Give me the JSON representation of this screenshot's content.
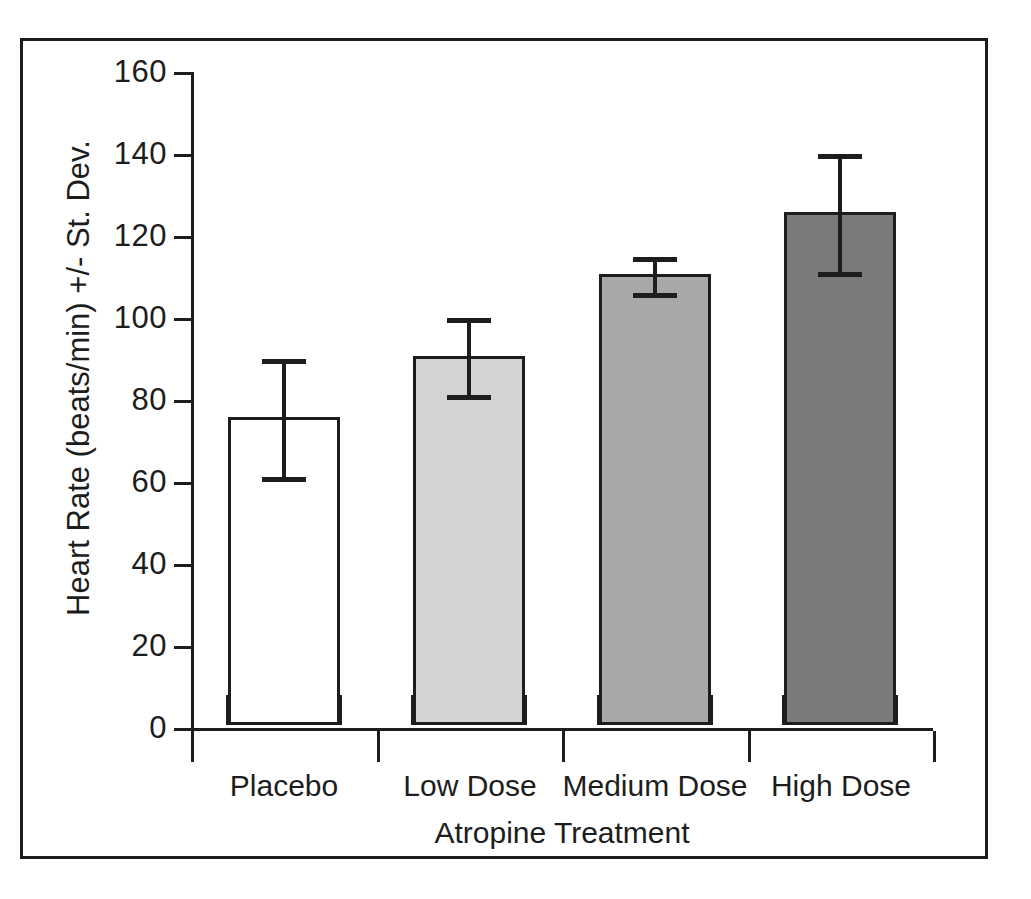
{
  "chart_data": {
    "type": "bar",
    "title": "",
    "xlabel": "Atropine Treatment",
    "ylabel": "Heart Rate (beats/min) +/- St. Dev.",
    "categories": [
      "Placebo",
      "Low Dose",
      "Medium Dose",
      "High Dose"
    ],
    "values": [
      75,
      90,
      110,
      125
    ],
    "errors": [
      15,
      10,
      5,
      15
    ],
    "error_type": "standard deviation",
    "ylim": [
      0,
      160
    ],
    "yticks": [
      0,
      20,
      40,
      60,
      80,
      100,
      120,
      140,
      160
    ],
    "ytick_labels": [
      "0",
      "20",
      "40",
      "60",
      "80",
      "100",
      "120",
      "140",
      "160"
    ],
    "grid": false,
    "legend": false,
    "bar_colors": [
      "#ffffff",
      "#d3d3d3",
      "#a8a8a8",
      "#7a7a7a"
    ],
    "bar_edge_color": "#1d1d1d",
    "frame_color": "#1d1d1d",
    "bars": [
      {
        "category": "Placebo",
        "value": 75,
        "error": 15,
        "error_low": 60,
        "error_high": 90,
        "fill": "#ffffff"
      },
      {
        "category": "Low Dose",
        "value": 90,
        "error": 10,
        "error_low": 80,
        "error_high": 100,
        "fill": "#d3d3d3"
      },
      {
        "category": "Medium Dose",
        "value": 110,
        "error": 5,
        "error_low": 105,
        "error_high": 115,
        "fill": "#a8a8a8"
      },
      {
        "category": "High Dose",
        "value": 125,
        "error": 15,
        "error_low": 110,
        "error_high": 140,
        "fill": "#7a7a7a"
      }
    ]
  }
}
